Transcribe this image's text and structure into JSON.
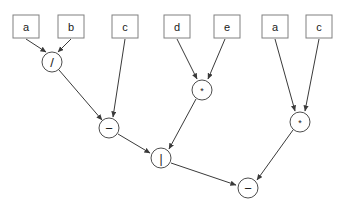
{
  "diagram": {
    "background_color": "#ffffff",
    "box_border_color": "#808080",
    "circle_border_color": "#4d4d4d",
    "edge_color": "#3a3a3a",
    "text_color": "#1a1a1a",
    "leaves": [
      {
        "id": "leaf-a1",
        "label": "a",
        "x": 13,
        "y": 15,
        "w": 26,
        "h": 23
      },
      {
        "id": "leaf-b",
        "label": "b",
        "x": 58,
        "y": 15,
        "w": 26,
        "h": 23
      },
      {
        "id": "leaf-c1",
        "label": "c",
        "x": 112,
        "y": 15,
        "w": 26,
        "h": 23
      },
      {
        "id": "leaf-d",
        "label": "d",
        "x": 164,
        "y": 15,
        "w": 26,
        "h": 23
      },
      {
        "id": "leaf-e",
        "label": "e",
        "x": 214,
        "y": 15,
        "w": 26,
        "h": 23
      },
      {
        "id": "leaf-a2",
        "label": "a",
        "x": 262,
        "y": 15,
        "w": 26,
        "h": 23
      },
      {
        "id": "leaf-c2",
        "label": "c",
        "x": 306,
        "y": 15,
        "w": 26,
        "h": 23
      }
    ],
    "operators": [
      {
        "id": "op-div",
        "label": "/",
        "glyph_class": "glyph-slash",
        "cx": 52,
        "cy": 62,
        "r": 10
      },
      {
        "id": "op-minus1",
        "label": "−",
        "glyph_class": "glyph-minus",
        "cx": 109,
        "cy": 128,
        "r": 10
      },
      {
        "id": "op-mul1",
        "label": "*",
        "glyph_class": "glyph-star",
        "cx": 202,
        "cy": 90,
        "r": 10
      },
      {
        "id": "op-pipe",
        "label": "|",
        "glyph_class": "glyph-pipe",
        "cx": 161,
        "cy": 158,
        "r": 10
      },
      {
        "id": "op-mul2",
        "label": "*",
        "glyph_class": "glyph-star",
        "cx": 300,
        "cy": 122,
        "r": 10
      },
      {
        "id": "op-minus2",
        "label": "−",
        "glyph_class": "glyph-minus",
        "cx": 248,
        "cy": 188,
        "r": 10
      }
    ],
    "edges": [
      {
        "id": "edge-a1-div",
        "from": "leaf-a1",
        "to": "op-div",
        "x1": 26,
        "y1": 39,
        "x2": 46,
        "y2": 52
      },
      {
        "id": "edge-b-div",
        "from": "leaf-b",
        "to": "op-div",
        "x1": 71,
        "y1": 39,
        "x2": 58,
        "y2": 52
      },
      {
        "id": "edge-div-minus1",
        "from": "op-div",
        "to": "op-minus1",
        "x1": 59,
        "y1": 70,
        "x2": 102,
        "y2": 120
      },
      {
        "id": "edge-c1-minus1",
        "from": "leaf-c1",
        "to": "op-minus1",
        "x1": 125,
        "y1": 39,
        "x2": 113,
        "y2": 117
      },
      {
        "id": "edge-d-mul1",
        "from": "leaf-d",
        "to": "op-mul1",
        "x1": 177,
        "y1": 39,
        "x2": 197,
        "y2": 79
      },
      {
        "id": "edge-e-mul1",
        "from": "leaf-e",
        "to": "op-mul1",
        "x1": 225,
        "y1": 39,
        "x2": 208,
        "y2": 79
      },
      {
        "id": "edge-minus1-pipe",
        "from": "op-minus1",
        "to": "op-pipe",
        "x1": 118,
        "y1": 134,
        "x2": 150,
        "y2": 153
      },
      {
        "id": "edge-mul1-pipe",
        "from": "op-mul1",
        "to": "op-pipe",
        "x1": 196,
        "y1": 99,
        "x2": 169,
        "y2": 149
      },
      {
        "id": "edge-a2-mul2",
        "from": "leaf-a2",
        "to": "op-mul2",
        "x1": 275,
        "y1": 39,
        "x2": 295,
        "y2": 111
      },
      {
        "id": "edge-c2-mul2",
        "from": "leaf-c2",
        "to": "op-mul2",
        "x1": 319,
        "y1": 39,
        "x2": 305,
        "y2": 111
      },
      {
        "id": "edge-pipe-minus2",
        "from": "op-pipe",
        "to": "op-minus2",
        "x1": 171,
        "y1": 163,
        "x2": 236,
        "y2": 185
      },
      {
        "id": "edge-mul2-minus2",
        "from": "op-mul2",
        "to": "op-minus2",
        "x1": 293,
        "y1": 130,
        "x2": 257,
        "y2": 180
      }
    ]
  }
}
